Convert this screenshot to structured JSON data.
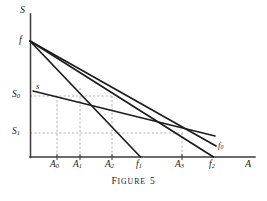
{
  "figure": {
    "caption_word": "Figure",
    "caption_number": "5",
    "caption_full": "FIGURE 5"
  },
  "axes": {
    "y_label": "S",
    "x_label": "A"
  },
  "labels": {
    "origin_point": "f",
    "supply_curve": "s",
    "demand_curve_0": "f",
    "demand_curve_0_sub": "0",
    "y_tick_0": "S",
    "y_tick_0_sub": "0",
    "y_tick_1": "S",
    "y_tick_1_sub": "1",
    "x_tick_0": "A",
    "x_tick_0_sub": "0",
    "x_tick_1": "A",
    "x_tick_1_sub": "1",
    "x_tick_2": "A",
    "x_tick_2_sub": "2",
    "x_tick_3": "A",
    "x_tick_3_sub": "3",
    "x_int_1": "f",
    "x_int_1_sub": "1",
    "x_int_2": "f",
    "x_int_2_sub": "2"
  },
  "colors": {
    "ink": "#1a1a1a",
    "line": "#262626",
    "dashed": "#9a9a9a",
    "background": "#ffffff"
  },
  "chart_data": {
    "type": "line",
    "xlabel": "A",
    "ylabel": "S",
    "grid": false,
    "legend": "inline-annotations",
    "xlim": [
      0,
      225
    ],
    "ylim": [
      0,
      143
    ],
    "axis_pixels": {
      "origin": [
        30,
        157
      ],
      "y_axis_top": [
        30,
        14
      ],
      "x_axis_right": [
        255,
        157
      ]
    },
    "marked_levels": {
      "S0": {
        "label": "S0",
        "y_pixel": 96
      },
      "S1": {
        "label": "S1",
        "y_pixel": 133
      }
    },
    "marked_abscissas": {
      "A0": {
        "label": "A0",
        "x_pixel": 57
      },
      "A1": {
        "label": "A1",
        "x_pixel": 80
      },
      "A2": {
        "label": "A2",
        "x_pixel": 112
      },
      "A3": {
        "label": "A3",
        "x_pixel": 182
      },
      "f1": {
        "label": "f1",
        "x_pixel": 140
      },
      "f2": {
        "label": "f2",
        "x_pixel": 213
      }
    },
    "series": [
      {
        "name": "s",
        "description": "supply schedule, upper-left to lower-right shallow line",
        "points_pixel": [
          [
            33,
            91
          ],
          [
            215,
            136
          ]
        ]
      },
      {
        "name": "f1",
        "description": "steepest demand line from f to x-axis at f1",
        "points_pixel": [
          [
            30,
            41
          ],
          [
            140,
            157
          ]
        ]
      },
      {
        "name": "f2",
        "description": "middle demand line from f to x-axis at f2",
        "points_pixel": [
          [
            30,
            41
          ],
          [
            213,
            157
          ]
        ]
      },
      {
        "name": "f0",
        "description": "flattest demand line from f toward the right, labelled f0",
        "points_pixel": [
          [
            30,
            41
          ],
          [
            216,
            146
          ]
        ]
      }
    ],
    "dashed_guides": [
      {
        "type": "horizontal",
        "level": "S0",
        "from_pixel": [
          30,
          96
        ],
        "to_pixel": [
          113,
          96
        ]
      },
      {
        "type": "horizontal",
        "level": "S1",
        "from_pixel": [
          30,
          133
        ],
        "to_pixel": [
          183,
          133
        ]
      },
      {
        "type": "vertical",
        "at": "A0",
        "from_pixel": [
          57,
          96
        ],
        "to_pixel": [
          57,
          157
        ]
      },
      {
        "type": "vertical",
        "at": "A1",
        "from_pixel": [
          80,
          88
        ],
        "to_pixel": [
          80,
          157
        ]
      },
      {
        "type": "vertical",
        "at": "A2",
        "from_pixel": [
          112,
          96
        ],
        "to_pixel": [
          112,
          157
        ]
      },
      {
        "type": "vertical",
        "at": "A3",
        "from_pixel": [
          182,
          133
        ],
        "to_pixel": [
          182,
          157
        ]
      }
    ]
  }
}
